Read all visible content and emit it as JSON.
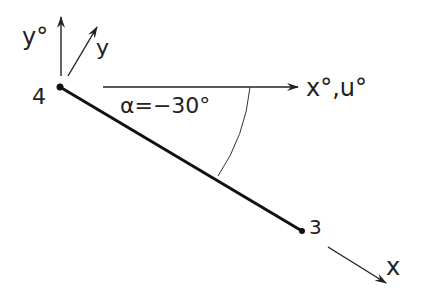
{
  "diagram": {
    "nodes": [
      {
        "id": "node-4",
        "label": "4"
      },
      {
        "id": "node-3",
        "label": "3"
      }
    ],
    "axes": {
      "global_y": "y°",
      "local_y": "y",
      "global_x": "x°,u°",
      "local_x": "x"
    },
    "angle_label": "α=−30°",
    "angle_value_deg": -30,
    "colors": {
      "ink": "#222222",
      "background": "#ffffff"
    }
  }
}
